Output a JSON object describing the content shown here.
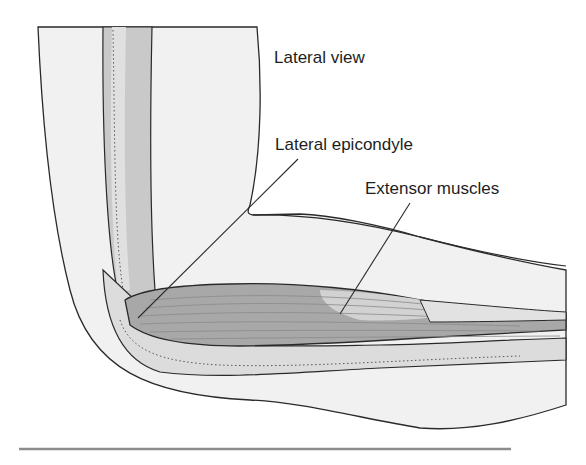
{
  "diagram": {
    "labels": {
      "view": "Lateral view",
      "epicondyle": "Lateral epicondyle",
      "muscles": "Extensor muscles"
    },
    "colors": {
      "background": "#ffffff",
      "skin_fill": "#f1f1f1",
      "outline": "#2a2a2a",
      "bone_dark": "#bdbdbd",
      "bone_light": "#dcdcdc",
      "muscle_fill": "#a8a8a8",
      "muscle_light": "#d2d2d2",
      "tendon_fill": "#e2e2e2",
      "rule": "#8c8c8c"
    }
  }
}
